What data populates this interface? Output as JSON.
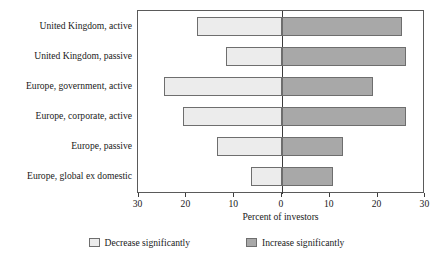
{
  "chart_data": {
    "type": "bar",
    "orientation": "horizontal-diverging",
    "title": "",
    "xlabel": "Percent of investors",
    "ylabel": "",
    "xlim": [
      -30,
      30
    ],
    "xticks": [
      -30,
      -20,
      -10,
      0,
      10,
      20,
      30
    ],
    "xtick_labels": [
      "30",
      "20",
      "10",
      "0",
      "10",
      "20",
      "30"
    ],
    "grid": false,
    "legend_position": "bottom",
    "categories": [
      "United Kingdom, active",
      "United Kingdom, passive",
      "Europe, government, active",
      "Europe, corporate, active",
      "Europe, passive",
      "Europe, global ex domestic"
    ],
    "series": [
      {
        "name": "Decrease significantly",
        "color": "#ececec",
        "direction": "left",
        "values": [
          17.7,
          11.7,
          24.7,
          20.7,
          13.6,
          6.4
        ]
      },
      {
        "name": "Increase significantly",
        "color": "#a8a8a8",
        "direction": "right",
        "values": [
          25.0,
          26.0,
          19.0,
          26.0,
          12.7,
          10.6
        ]
      }
    ]
  },
  "legend": {
    "items": [
      {
        "label": "Decrease significantly",
        "swatch": "light-gray-swatch"
      },
      {
        "label": "Increase significantly",
        "swatch": "dark-gray-swatch"
      }
    ]
  }
}
